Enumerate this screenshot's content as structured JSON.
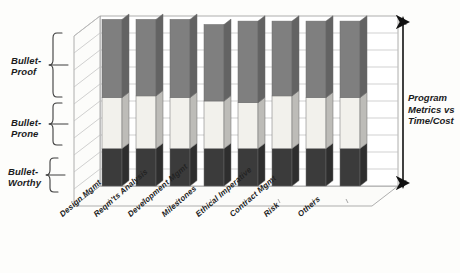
{
  "chart_data": {
    "type": "bar",
    "subtype": "3d-stacked-column",
    "title": "",
    "xlabel": "",
    "ylabel": "Program Metrics vs Time/Cost",
    "ylim": [
      0,
      100
    ],
    "grid": true,
    "gridlines": 10,
    "legend_position": "none",
    "categories": [
      "Design Mgmt",
      "Reqm'ts Analysis",
      "Development Mgmt",
      "Milestones",
      "Ethical Imperative",
      "Contract Mgmt",
      "Risk",
      "Others"
    ],
    "series": [
      {
        "name": "Bullet-Worthy",
        "color": "#3b3b3b",
        "values": [
          22,
          22,
          22,
          22,
          22,
          22,
          22,
          22
        ]
      },
      {
        "name": "Bullet-Prone",
        "color": "#f2f1ec",
        "values": [
          30,
          31,
          30,
          28,
          27,
          31,
          30,
          30
        ]
      },
      {
        "name": "Bullet-Proof",
        "color": "#7f7f7f",
        "values": [
          46,
          45,
          46,
          45,
          48,
          44,
          45,
          45
        ]
      }
    ],
    "annotations": [
      {
        "name": "zone-brace-bullet-proof",
        "label": "Bullet-\nProof",
        "range": [
          52,
          100
        ]
      },
      {
        "name": "zone-brace-bullet-prone",
        "label": "Bullet-\nProne",
        "range": [
          22,
          52
        ]
      },
      {
        "name": "zone-brace-bullet-worthy",
        "label": "Bullet-\nWorthy",
        "range": [
          0,
          22
        ]
      },
      {
        "name": "axis-range-arrow",
        "label": "Program\nMetrics vs\nTime/Cost"
      }
    ]
  },
  "zones": {
    "bullet_proof": "Bullet-\nProof",
    "bullet_prone": "Bullet-\nProne",
    "bullet_worthy": "Bullet-\nWorthy"
  },
  "right_annotation": {
    "text": "Program\nMetrics vs\nTime/Cost"
  }
}
